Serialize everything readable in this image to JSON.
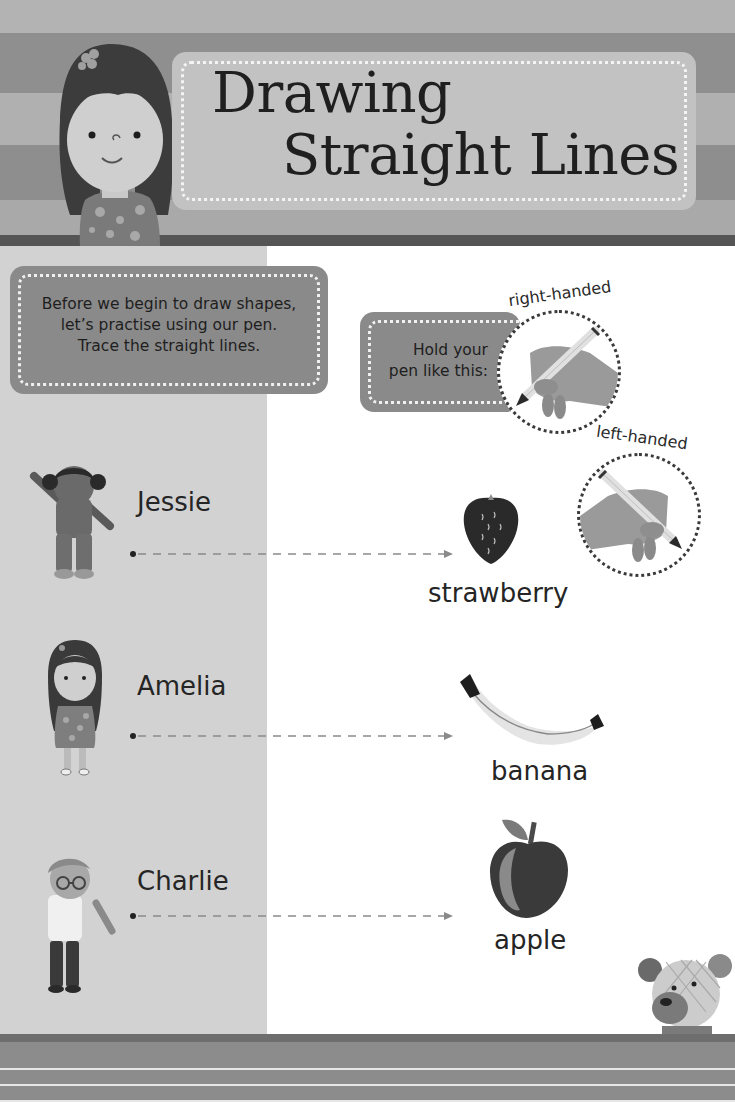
{
  "header": {
    "title_line1": "Drawing",
    "title_line2": "Straight Lines"
  },
  "intro": {
    "line1": "Before we begin to draw shapes,",
    "line2": "let’s practise using our pen.",
    "line3": "Trace the straight lines."
  },
  "pen_grip": {
    "prompt_line1": "Hold your",
    "prompt_line2": "pen like this:",
    "right_label": "right-handed",
    "left_label": "left-handed"
  },
  "rows": [
    {
      "name": "Jessie",
      "fruit": "strawberry",
      "fruit_icon": "strawberry-icon"
    },
    {
      "name": "Amelia",
      "fruit": "banana",
      "fruit_icon": "banana-icon"
    },
    {
      "name": "Charlie",
      "fruit": "apple",
      "fruit_icon": "apple-icon"
    }
  ],
  "colors": {
    "header_stripe_dark": "#8f8f8f",
    "header_stripe_light": "#b0b0b0",
    "title_box": "#c2c2c2",
    "left_panel": "#d2d2d2",
    "callout_box": "#8a8a8a",
    "trace_line": "#8a8a8a",
    "footer": "#8c8c8c"
  }
}
